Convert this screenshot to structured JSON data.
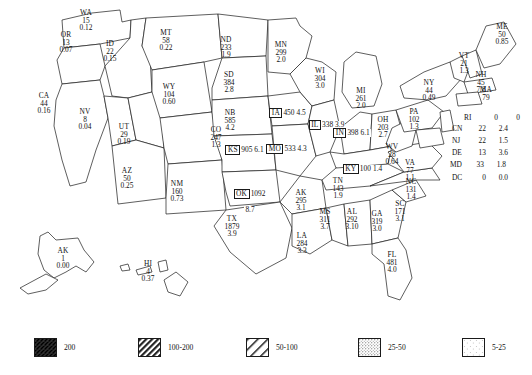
{
  "chart_data": {
    "type": "map",
    "title": "",
    "subtitle": "",
    "value_fields": [
      "count",
      "density"
    ],
    "legend": {
      "position": "bottom",
      "entries": [
        {
          "label": "200",
          "pattern": "dense-crosshatch-dark",
          "order": 1
        },
        {
          "label": "100-200",
          "pattern": "dense-diagonal-hatch",
          "order": 2
        },
        {
          "label": "50-100",
          "pattern": "wide-diagonal-hatch",
          "order": 3
        },
        {
          "label": "25-50",
          "pattern": "dense-stipple",
          "order": 4
        },
        {
          "label": "5-25",
          "pattern": "sparse-stipple",
          "order": 5
        }
      ]
    },
    "states": [
      {
        "abbr": "WA",
        "count": "15",
        "density": "0.12",
        "class": "none",
        "label_x": 86,
        "label_y": 14,
        "boxed": false
      },
      {
        "abbr": "OR",
        "count": "13",
        "density": "0.07",
        "class": "none",
        "label_x": 66,
        "label_y": 36,
        "boxed": false
      },
      {
        "abbr": "CA",
        "count": "44",
        "density": "0.16",
        "class": "none",
        "label_x": 44,
        "label_y": 97,
        "boxed": false,
        "split_label": true
      },
      {
        "abbr": "ID",
        "count": "22",
        "density": "0.15",
        "class": "5-25",
        "label_x": 110,
        "label_y": 45,
        "boxed": false,
        "split_label": true
      },
      {
        "abbr": "NV",
        "count": "8",
        "density": "0.04",
        "class": "none",
        "label_x": 85,
        "label_y": 113,
        "boxed": false
      },
      {
        "abbr": "UT",
        "count": "29",
        "density": "0.19",
        "class": "5-25",
        "label_x": 124,
        "label_y": 128,
        "boxed": false
      },
      {
        "abbr": "AZ",
        "count": "50",
        "density": "0.25",
        "class": "5-25",
        "label_x": 127,
        "label_y": 172,
        "boxed": false
      },
      {
        "abbr": "MT",
        "count": "58",
        "density": "0.22",
        "class": "5-25",
        "label_x": 166,
        "label_y": 34,
        "boxed": false
      },
      {
        "abbr": "WY",
        "count": "104",
        "density": "0.60",
        "class": "25-50",
        "label_x": 169,
        "label_y": 88,
        "boxed": false
      },
      {
        "abbr": "CO",
        "count": "247",
        "density": "1.3",
        "class": "25-50",
        "label_x": 216,
        "label_y": 131,
        "boxed": false
      },
      {
        "abbr": "NM",
        "count": "160",
        "density": "0.73",
        "class": "5-25",
        "label_x": 177,
        "label_y": 185,
        "boxed": false
      },
      {
        "abbr": "ND",
        "count": "233",
        "density": "1.9",
        "class": "25-50",
        "label_x": 226,
        "label_y": 41,
        "boxed": false
      },
      {
        "abbr": "SD",
        "count": "384",
        "density": "2.8",
        "class": "25-50",
        "label_x": 229,
        "label_y": 76,
        "boxed": false
      },
      {
        "abbr": "NB",
        "count": "585",
        "density": "4.2",
        "class": "25-50",
        "label_x": 230,
        "label_y": 114,
        "boxed": false
      },
      {
        "abbr": "KS",
        "count": "905",
        "density": "6.1",
        "class": "50-100",
        "label_x": 245,
        "label_y": 144,
        "boxed": true
      },
      {
        "abbr": "OK",
        "count": "1092",
        "density": "8.7",
        "class": "200",
        "label_x": 250,
        "label_y": 188,
        "boxed": true
      },
      {
        "abbr": "TX",
        "count": "1879",
        "density": "3.9",
        "class": "50-100",
        "label_x": 232,
        "label_y": 220,
        "boxed": false
      },
      {
        "abbr": "MN",
        "count": "299",
        "density": "2.0",
        "class": "50-100",
        "label_x": 281,
        "label_y": 46,
        "boxed": false,
        "split_label": true
      },
      {
        "abbr": "IA",
        "count": "450",
        "density": "4.5",
        "class": "50-100",
        "label_x": 288,
        "label_y": 107,
        "boxed": true
      },
      {
        "abbr": "MO",
        "count": "533",
        "density": "4.3",
        "class": "100-200",
        "label_x": 287,
        "label_y": 143,
        "boxed": true
      },
      {
        "abbr": "AK",
        "count": "295",
        "density": "3.1",
        "class": "50-100",
        "label_x": 301,
        "label_y": 194,
        "boxed": false
      },
      {
        "abbr": "LA",
        "count": "284",
        "density": "3.3",
        "class": "50-100",
        "label_x": 302,
        "label_y": 237,
        "boxed": false
      },
      {
        "abbr": "MS",
        "count": "311",
        "density": "3.7",
        "class": "50-100",
        "label_x": 325,
        "label_y": 213,
        "boxed": false
      },
      {
        "abbr": "AL",
        "count": "292",
        "density": "3.10",
        "class": "50-100",
        "label_x": 352,
        "label_y": 213,
        "boxed": false
      },
      {
        "abbr": "WI",
        "count": "304",
        "density": "3.0",
        "class": "50-100",
        "label_x": 320,
        "label_y": 72,
        "boxed": false
      },
      {
        "abbr": "IL",
        "count": "338",
        "density": "3.9",
        "class": "100-200",
        "label_x": 327,
        "label_y": 119,
        "boxed": true
      },
      {
        "abbr": "MI",
        "count": "261",
        "density": "2.0",
        "class": "50-100",
        "label_x": 361,
        "label_y": 92,
        "boxed": false
      },
      {
        "abbr": "IN",
        "count": "398",
        "density": "6.1",
        "class": "100-200",
        "label_x": 352,
        "label_y": 127,
        "boxed": true
      },
      {
        "abbr": "OH",
        "count": "203",
        "density": "2.7",
        "class": "100-200",
        "label_x": 383,
        "label_y": 121,
        "boxed": false
      },
      {
        "abbr": "KY",
        "count": "100",
        "density": "1.4",
        "class": "50-100",
        "label_x": 363,
        "label_y": 163,
        "boxed": true
      },
      {
        "abbr": "TN",
        "count": "143",
        "density": "1.9",
        "class": "50-100",
        "label_x": 338,
        "label_y": 182,
        "boxed": false
      },
      {
        "abbr": "GA",
        "count": "319",
        "density": "3.0",
        "class": "50-100",
        "label_x": 377,
        "label_y": 215,
        "boxed": false
      },
      {
        "abbr": "SC",
        "count": "171",
        "density": "3.1",
        "class": "50-100",
        "label_x": 400,
        "label_y": 205,
        "boxed": false
      },
      {
        "abbr": "NC",
        "count": "131",
        "density": "1.4",
        "class": "50-100",
        "label_x": 411,
        "label_y": 183,
        "boxed": false
      },
      {
        "abbr": "VA",
        "count": "77",
        "density": "1.1",
        "class": "50-100",
        "label_x": 410,
        "label_y": 164,
        "boxed": false
      },
      {
        "abbr": "WV",
        "count": "28",
        "density": "0.64",
        "class": "50-100",
        "label_x": 392,
        "label_y": 148,
        "boxed": false
      },
      {
        "abbr": "PA",
        "count": "102",
        "density": "1.3",
        "class": "50-100",
        "label_x": 414,
        "label_y": 113,
        "boxed": false
      },
      {
        "abbr": "NY",
        "count": "44",
        "density": "0.49",
        "class": "25-50",
        "label_x": 429,
        "label_y": 84,
        "boxed": false
      },
      {
        "abbr": "VT",
        "count": "21",
        "density": "1.3",
        "class": "25-50",
        "label_x": 464,
        "label_y": 57,
        "boxed": false
      },
      {
        "abbr": "NH",
        "count": "45",
        "density": "7.8",
        "class": "25-50",
        "label_x": 481,
        "label_y": 76,
        "boxed": false
      },
      {
        "abbr": "ME",
        "count": "50",
        "density": "0.85",
        "class": "25-50",
        "label_x": 502,
        "label_y": 28,
        "boxed": false
      },
      {
        "abbr": "MA",
        "count": "79",
        "density": "",
        "class": "50-100",
        "label_x": 486,
        "label_y": 91,
        "boxed": false
      },
      {
        "abbr": "FL",
        "count": "481",
        "density": "4.0",
        "class": "25-50",
        "label_x": 392,
        "label_y": 256,
        "boxed": false
      },
      {
        "abbr": "AK",
        "count": "1",
        "density": "0.00",
        "class": "none",
        "label_x": 63,
        "label_y": 252,
        "boxed": false,
        "inset": true
      },
      {
        "abbr": "HI",
        "count": "4",
        "density": "0.37",
        "class": "none",
        "label_x": 148,
        "label_y": 265,
        "boxed": false,
        "inset": true
      }
    ],
    "callouts": [
      {
        "abbr": "RI",
        "count": "0",
        "density": "0",
        "x": 464,
        "y": 113
      },
      {
        "abbr": "CN",
        "count": "22",
        "density": "2.4",
        "x": 452,
        "y": 124
      },
      {
        "abbr": "NJ",
        "count": "22",
        "density": "1.5",
        "x": 452,
        "y": 136
      },
      {
        "abbr": "DE",
        "count": "13",
        "density": "3.6",
        "x": 452,
        "y": 148
      },
      {
        "abbr": "MD",
        "count": "33",
        "density": "1.8",
        "x": 450,
        "y": 160
      },
      {
        "abbr": "DC",
        "count": "0",
        "density": "0.0",
        "x": 452,
        "y": 173
      }
    ]
  }
}
